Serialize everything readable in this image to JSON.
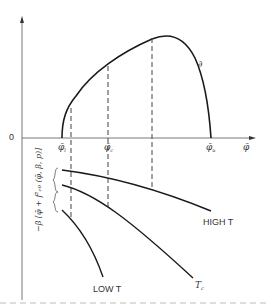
{
  "diagram": {
    "origin_label": "0",
    "x_axis_label": "φ̄",
    "upper_curve_label": "∂",
    "x_ticks": [
      {
        "base": "φ̄",
        "sub": "l"
      },
      {
        "base": "φ̄",
        "sub": "c"
      },
      {
        "base": "φ̄",
        "sub": "u"
      }
    ],
    "y_lower_label": "−β [φ̄ + f²ₑ₀ (φ̄, β, p)]",
    "curves": [
      {
        "name": "HIGH T",
        "label": "HIGH T"
      },
      {
        "name": "T_c",
        "label_base": "T",
        "label_sub": "c"
      },
      {
        "name": "LOW T",
        "label": "LOW T"
      }
    ],
    "colors": {
      "line": "#222222",
      "text": "#333333",
      "dashed": "#444444"
    }
  }
}
